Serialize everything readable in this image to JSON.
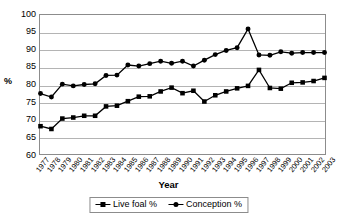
{
  "chart_data": {
    "type": "line",
    "title": "",
    "xlabel": "Year",
    "ylabel": "%",
    "ylim": [
      60,
      100
    ],
    "ytick_step": 5,
    "yticks": [
      100,
      95,
      90,
      85,
      80,
      75,
      70,
      65,
      60
    ],
    "grid": true,
    "legend_position": "bottom",
    "categories": [
      "1977",
      "1978",
      "1979",
      "1980",
      "1981",
      "1982",
      "1983",
      "1984",
      "1985",
      "1986",
      "1987",
      "1988",
      "1989",
      "1990",
      "1991",
      "1992",
      "1993",
      "1994",
      "1995",
      "1996",
      "1997",
      "1998",
      "1999",
      "2000",
      "2001",
      "2002",
      "2003"
    ],
    "series": [
      {
        "name": "Live foal %",
        "marker": "square",
        "color": "#000000",
        "values": [
          68.0,
          67.2,
          70.2,
          70.5,
          71.0,
          71.0,
          73.7,
          73.9,
          75.2,
          76.5,
          76.6,
          78.0,
          79.1,
          77.5,
          78.2,
          75.1,
          76.9,
          78.0,
          78.9,
          79.6,
          84.2,
          79.0,
          78.8,
          80.5,
          80.6,
          81.0,
          81.9
        ]
      },
      {
        "name": "Conception %",
        "marker": "circle",
        "color": "#000000",
        "values": [
          77.4,
          76.4,
          80.1,
          79.6,
          80.0,
          80.2,
          82.6,
          82.7,
          85.6,
          85.3,
          86.0,
          86.7,
          86.1,
          86.7,
          85.3,
          87.0,
          88.6,
          89.8,
          90.6,
          96.0,
          88.5,
          88.4,
          89.4,
          89.0,
          89.2,
          89.2,
          89.2
        ]
      }
    ]
  },
  "legend": {
    "entries": [
      {
        "label": "Live foal %"
      },
      {
        "label": "Conception %"
      }
    ]
  },
  "axes": {
    "x_title": "Year",
    "y_title": "%"
  }
}
